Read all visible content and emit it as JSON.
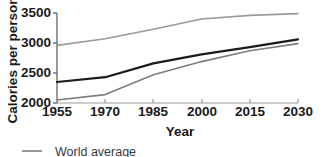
{
  "chart_data": {
    "type": "line",
    "title": "",
    "xlabel": "Year",
    "ylabel": "Calories per person",
    "x": [
      1955,
      1970,
      1985,
      2000,
      2015,
      2030
    ],
    "xlim": [
      1955,
      2030
    ],
    "ylim": [
      2000,
      3500
    ],
    "xticks": [
      1955,
      1970,
      1985,
      2000,
      2015,
      2030
    ],
    "xtick_labels": [
      "1955",
      "1970",
      "1985",
      "2000",
      "2015",
      "2030"
    ],
    "yticks": [
      2000,
      2500,
      3000,
      3500
    ],
    "ytick_labels": [
      "2000",
      "2500",
      "3000",
      "3500"
    ],
    "grid": false,
    "legend_position": "bottom-left",
    "series": [
      {
        "name": "Industrial countries",
        "color": "#9a9a9a",
        "width": 1.6,
        "values": [
          2960,
          3070,
          3230,
          3400,
          3460,
          3490
        ]
      },
      {
        "name": "World average",
        "color": "#1a1a1a",
        "width": 2.2,
        "values": [
          2350,
          2430,
          2660,
          2810,
          2930,
          3060
        ]
      },
      {
        "name": "Developing countries",
        "color": "#7d7d7d",
        "width": 1.6,
        "values": [
          2050,
          2140,
          2470,
          2690,
          2870,
          2990
        ]
      }
    ]
  },
  "axes": {
    "x_title": "Year",
    "y_title": "Calories per person"
  },
  "legend": {
    "items": [
      {
        "label": "World average",
        "color": "#7d7d7d",
        "marker": "line-dash"
      }
    ]
  }
}
